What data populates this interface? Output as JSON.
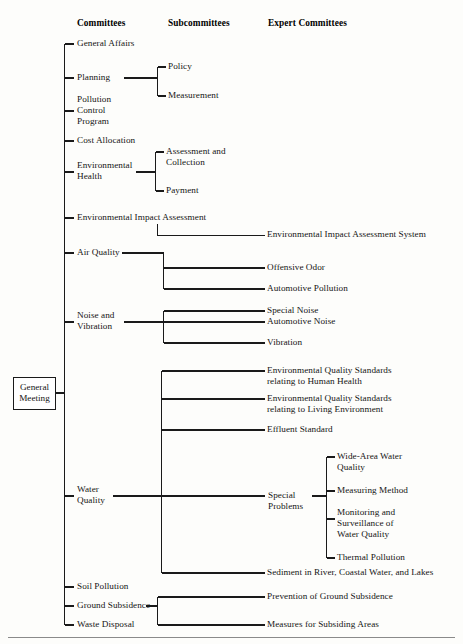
{
  "diagram": {
    "root": {
      "label": "General\nMeeting"
    },
    "columns": [
      {
        "id": "committees",
        "label": "Committees"
      },
      {
        "id": "subcommittees",
        "label": "Subcommittees"
      },
      {
        "id": "expert_committees",
        "label": "Expert Committees"
      }
    ],
    "committees": [
      {
        "id": "general-affairs",
        "label": "General Affairs"
      },
      {
        "id": "planning",
        "label": "Planning"
      },
      {
        "id": "pollution-control-program",
        "label": "Pollution\nControl\nProgram"
      },
      {
        "id": "cost-allocation",
        "label": "Cost Allocation"
      },
      {
        "id": "environmental-health",
        "label": "Environmental\nHealth"
      },
      {
        "id": "environmental-impact-assessment",
        "label": "Environmental Impact Assessment"
      },
      {
        "id": "air-quality",
        "label": "Air Quality"
      },
      {
        "id": "noise-and-vibration",
        "label": "Noise and\nVibration"
      },
      {
        "id": "water-quality",
        "label": "Water\nQuality"
      },
      {
        "id": "soil-pollution",
        "label": "Soil Pollution"
      },
      {
        "id": "ground-subsidence",
        "label": "Ground Subsidence"
      },
      {
        "id": "waste-disposal",
        "label": "Waste Disposal"
      }
    ],
    "subcommittees": [
      {
        "id": "policy",
        "label": "Policy",
        "parent": "planning"
      },
      {
        "id": "measurement",
        "label": "Measurement",
        "parent": "planning"
      },
      {
        "id": "assessment-and-collection",
        "label": "Assessment and\nCollection",
        "parent": "environmental-health"
      },
      {
        "id": "payment",
        "label": "Payment",
        "parent": "environmental-health"
      },
      {
        "id": "special-problems",
        "label": "Special\nProblems",
        "parent": "water-quality"
      }
    ],
    "expert_committees": [
      {
        "id": "environmental-impact-assessment-system",
        "label": "Environmental Impact Assessment System",
        "parent": "environmental-impact-assessment"
      },
      {
        "id": "offensive-odor",
        "label": "Offensive Odor",
        "parent": "air-quality"
      },
      {
        "id": "automotive-pollution",
        "label": "Automotive Pollution",
        "parent": "air-quality"
      },
      {
        "id": "special-noise",
        "label": "Special Noise",
        "parent": "noise-and-vibration"
      },
      {
        "id": "automotive-noise",
        "label": "Automotive Noise",
        "parent": "noise-and-vibration"
      },
      {
        "id": "vibration",
        "label": "Vibration",
        "parent": "noise-and-vibration"
      },
      {
        "id": "eqs-human-health",
        "label": "Environmental Quality Standards\nrelating to Human Health",
        "parent": "water-quality"
      },
      {
        "id": "eqs-living-environment",
        "label": "Environmental Quality Standards\nrelating to Living Environment",
        "parent": "water-quality"
      },
      {
        "id": "effluent-standard",
        "label": "Effluent Standard",
        "parent": "water-quality"
      },
      {
        "id": "sediment-river-coastal-lakes",
        "label": "Sediment in River, Coastal Water, and Lakes",
        "parent": "water-quality"
      },
      {
        "id": "prevention-of-ground-subsidence",
        "label": "Prevention of Ground Subsidence",
        "parent": "ground-subsidence"
      },
      {
        "id": "measures-for-subsiding-areas",
        "label": "Measures for Subsiding Areas",
        "parent": "ground-subsidence"
      }
    ],
    "special_problem_items": [
      {
        "id": "wide-area-water-quality",
        "label": "Wide-Area Water\nQuality"
      },
      {
        "id": "measuring-method",
        "label": "Measuring Method"
      },
      {
        "id": "monitoring-and-surveillance",
        "label": "Monitoring and\nSurveillance of\nWater  Quality"
      },
      {
        "id": "thermal-pollution",
        "label": "Thermal Pollution"
      }
    ],
    "colors": {
      "line": "#1a1a1a",
      "text": "#151515",
      "background": "#fdfdfb",
      "rule": "#8a8a8a"
    }
  }
}
